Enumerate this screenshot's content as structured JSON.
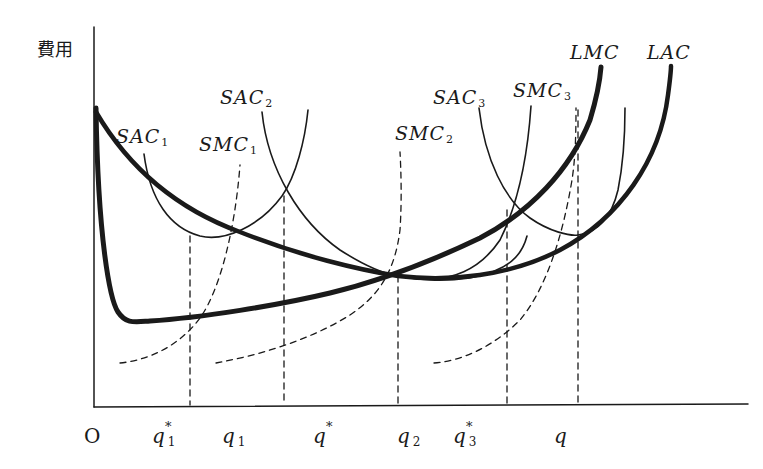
{
  "diagram": {
    "y_axis_label": "費用",
    "x_axis_label": "q",
    "origin_label": "O",
    "curve_labels": {
      "sac1": {
        "main": "SAC",
        "sub": "1"
      },
      "smc1": {
        "main": "SMC",
        "sub": "1"
      },
      "sac2": {
        "main": "SAC",
        "sub": "2"
      },
      "smc2": {
        "main": "SMC",
        "sub": "2"
      },
      "sac3": {
        "main": "SAC",
        "sub": "3"
      },
      "smc3": {
        "main": "SMC",
        "sub": "3"
      },
      "lmc": {
        "main": "LMC"
      },
      "lac": {
        "main": "LAC"
      }
    },
    "x_ticks": [
      {
        "main": "q",
        "sub": "1",
        "star": "*"
      },
      {
        "main": "q",
        "sub": "1",
        "star": ""
      },
      {
        "main": "q",
        "sub": "",
        "star": "*"
      },
      {
        "main": "q",
        "sub": "2",
        "star": ""
      },
      {
        "main": "q",
        "sub": "3",
        "star": "*"
      }
    ],
    "colors": {
      "ink": "#1a1a1a",
      "background": "#ffffff"
    }
  }
}
